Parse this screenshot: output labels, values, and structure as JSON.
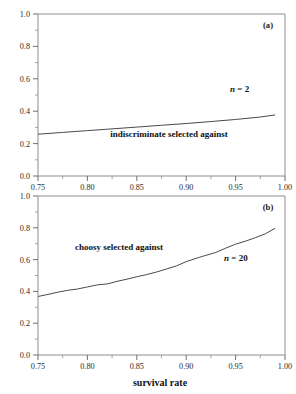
{
  "figure": {
    "x_axis_title": "survival rate",
    "panels": [
      {
        "panel_label": "(a)",
        "annotation": "indiscriminate selected against",
        "n_label_italic": "n",
        "n_label_rest": " = 2"
      },
      {
        "panel_label": "(b)",
        "annotation": "choosy selected against",
        "n_label_italic": "n",
        "n_label_rest": " = 20"
      }
    ],
    "y_ticks": [
      "0.0",
      "0.2",
      "0.4",
      "0.6",
      "0.8",
      "1.0"
    ],
    "x_ticks": [
      "0.75",
      "0.80",
      "0.85",
      "0.90",
      "0.95",
      "1.00"
    ]
  },
  "chart_data": [
    {
      "type": "line",
      "title": "(a)",
      "xlabel": "survival rate",
      "ylabel": "",
      "xlim": [
        0.75,
        1.0
      ],
      "ylim": [
        0.0,
        1.0
      ],
      "xticks": [
        0.75,
        0.8,
        0.85,
        0.9,
        0.95,
        1.0
      ],
      "yticks": [
        0.0,
        0.2,
        0.4,
        0.6,
        0.8,
        1.0
      ],
      "grid": false,
      "legend": "none",
      "annotations": [
        {
          "text": "(a)",
          "x": 0.965,
          "y": 0.935
        },
        {
          "text": "n = 2",
          "x": 0.925,
          "y": 0.5
        },
        {
          "text": "indiscriminate selected against",
          "x": 0.875,
          "y": 0.245
        }
      ],
      "series": [
        {
          "name": "threshold n = 2",
          "x": [
            0.75,
            0.775,
            0.8,
            0.825,
            0.85,
            0.875,
            0.9,
            0.925,
            0.95,
            0.975,
            0.99
          ],
          "values": [
            0.258,
            0.269,
            0.28,
            0.291,
            0.302,
            0.313,
            0.324,
            0.336,
            0.349,
            0.364,
            0.377
          ]
        }
      ]
    },
    {
      "type": "line",
      "title": "(b)",
      "xlabel": "survival rate",
      "ylabel": "",
      "xlim": [
        0.75,
        1.0
      ],
      "ylim": [
        0.0,
        1.0
      ],
      "xticks": [
        0.75,
        0.8,
        0.85,
        0.9,
        0.95,
        1.0
      ],
      "yticks": [
        0.0,
        0.2,
        0.4,
        0.6,
        0.8,
        1.0
      ],
      "grid": false,
      "legend": "none",
      "annotations": [
        {
          "text": "(b)",
          "x": 0.965,
          "y": 0.935
        },
        {
          "text": "n = 20",
          "x": 0.925,
          "y": 0.585
        },
        {
          "text": "choosy selected against",
          "x": 0.828,
          "y": 0.66
        }
      ],
      "series": [
        {
          "name": "threshold n = 20",
          "x": [
            0.75,
            0.76,
            0.77,
            0.78,
            0.79,
            0.8,
            0.81,
            0.82,
            0.83,
            0.84,
            0.85,
            0.86,
            0.87,
            0.88,
            0.89,
            0.9,
            0.91,
            0.92,
            0.93,
            0.94,
            0.95,
            0.96,
            0.97,
            0.98,
            0.99
          ],
          "values": [
            0.368,
            0.381,
            0.395,
            0.407,
            0.415,
            0.428,
            0.441,
            0.447,
            0.463,
            0.477,
            0.492,
            0.506,
            0.522,
            0.541,
            0.56,
            0.587,
            0.608,
            0.627,
            0.645,
            0.672,
            0.697,
            0.716,
            0.738,
            0.762,
            0.797
          ]
        }
      ]
    }
  ]
}
